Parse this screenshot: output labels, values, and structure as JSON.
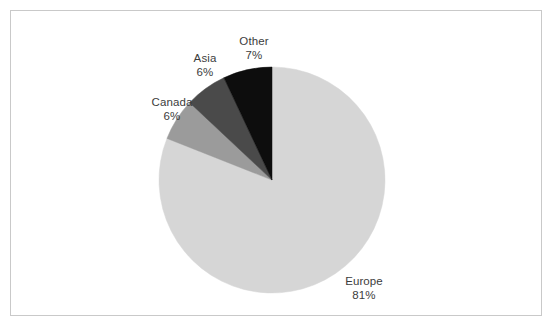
{
  "figure": {
    "background_color": "#ffffff",
    "border_color": "#c9c9c9",
    "label_text_color": "#3c3c3c"
  },
  "chart_data": {
    "type": "pie",
    "title": "",
    "subtitle": "",
    "xlabel": "",
    "ylabel": "",
    "legend_position": "none",
    "grid": false,
    "start_angle_deg": 0,
    "direction": "clockwise",
    "categories": [
      "Europe",
      "Canada",
      "Asia",
      "Other"
    ],
    "values": [
      81,
      6,
      6,
      7
    ],
    "value_unit": "%",
    "colors": [
      "#d6d6d6",
      "#9b9b9b",
      "#4a4a4a",
      "#0d0d0d"
    ],
    "slices": [
      {
        "name": "Europe",
        "value": 81,
        "value_label": "81%",
        "color": "#d6d6d6",
        "start_pct": 0,
        "end_pct": 81,
        "label_position": "outside-bottom-right"
      },
      {
        "name": "Canada",
        "value": 6,
        "value_label": "6%",
        "color": "#9b9b9b",
        "start_pct": 81,
        "end_pct": 87,
        "label_position": "outside-left"
      },
      {
        "name": "Asia",
        "value": 6,
        "value_label": "6%",
        "color": "#4a4a4a",
        "start_pct": 87,
        "end_pct": 93,
        "label_position": "outside-upper-left"
      },
      {
        "name": "Other",
        "value": 7,
        "value_label": "7%",
        "color": "#0d0d0d",
        "start_pct": 93,
        "end_pct": 100,
        "label_position": "outside-top"
      }
    ],
    "geometry": {
      "center_x": 272,
      "center_y": 180,
      "radius": 113
    }
  },
  "labels": {
    "other": {
      "name": "Other",
      "value": "7%"
    },
    "asia": {
      "name": "Asia",
      "value": "6%"
    },
    "canada": {
      "name": "Canada",
      "value": "6%"
    },
    "europe": {
      "name": "Europe",
      "value": "81%"
    }
  }
}
